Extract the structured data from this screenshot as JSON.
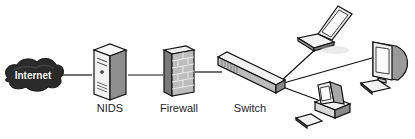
{
  "diagram": {
    "type": "network-topology",
    "nodes": [
      {
        "id": "internet",
        "label": "Internet",
        "shape": "cloud"
      },
      {
        "id": "nids",
        "label": "NIDS",
        "shape": "server-tower"
      },
      {
        "id": "firewall",
        "label": "Firewall",
        "shape": "brick-wall"
      },
      {
        "id": "switch",
        "label": "Switch",
        "shape": "network-switch"
      },
      {
        "id": "laptop",
        "label": "",
        "shape": "laptop"
      },
      {
        "id": "workstation-crt",
        "label": "",
        "shape": "crt-monitor-with-keyboard"
      },
      {
        "id": "desktop-pc",
        "label": "",
        "shape": "desktop-computer"
      }
    ],
    "edges": [
      {
        "from": "internet",
        "to": "nids"
      },
      {
        "from": "nids",
        "to": "firewall"
      },
      {
        "from": "firewall",
        "to": "switch"
      },
      {
        "from": "switch",
        "to": "laptop"
      },
      {
        "from": "switch",
        "to": "workstation-crt"
      },
      {
        "from": "switch",
        "to": "desktop-pc"
      }
    ]
  },
  "colors": {
    "line": "#111111",
    "cloud": "#2a2a2a",
    "device_body": "#f2f2f2",
    "device_shade": "#9a9a9a",
    "outline": "#111111"
  }
}
